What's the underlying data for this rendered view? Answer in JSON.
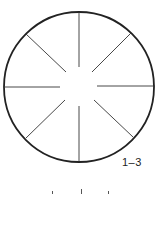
{
  "figure": {
    "label": "1–3",
    "shape": "circle-with-radial-spokes",
    "spoke_count": 8,
    "spoke_angles_deg": [
      0,
      45,
      90,
      135,
      180,
      225,
      270,
      315
    ],
    "stroke_color": "#222222",
    "background": "#ffffff"
  }
}
